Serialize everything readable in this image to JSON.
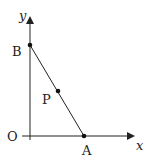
{
  "diagram": {
    "type": "coordinate-geometry",
    "axes": {
      "x_label": "x",
      "y_label": "y",
      "origin_label": "O"
    },
    "points": [
      {
        "name": "A",
        "label": "A",
        "on": "x-axis"
      },
      {
        "name": "B",
        "label": "B",
        "on": "y-axis"
      },
      {
        "name": "P",
        "label": "P",
        "on": "segment AB"
      }
    ],
    "segments": [
      {
        "from": "A",
        "to": "B"
      }
    ],
    "colors": {
      "stroke": "#222222",
      "background": "#ffffff"
    }
  }
}
